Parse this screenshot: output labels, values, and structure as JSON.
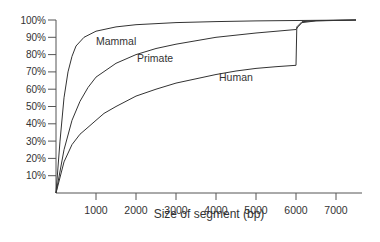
{
  "chart_data": {
    "type": "line",
    "title": "",
    "xlabel": "Size of segment (bp)",
    "ylabel": "",
    "xlim": [
      0,
      7650
    ],
    "ylim": [
      0,
      100
    ],
    "x_ticks": [
      1000,
      2000,
      3000,
      4000,
      5000,
      6000,
      7000
    ],
    "x_tick_labels": [
      "1000",
      "2000",
      "3000",
      "4000",
      "5000",
      "6000",
      "7000"
    ],
    "y_ticks": [
      10,
      20,
      30,
      40,
      50,
      60,
      70,
      80,
      90,
      100
    ],
    "y_tick_labels": [
      "10%",
      "20%",
      "30%",
      "40%",
      "50%",
      "60%",
      "70%",
      "80%",
      "90%",
      "100%"
    ],
    "grid": false,
    "legend": "inline labels",
    "series": [
      {
        "name": "Mammal",
        "label_pos": [
          1000,
          88
        ],
        "points": [
          [
            0,
            0
          ],
          [
            100,
            30
          ],
          [
            200,
            55
          ],
          [
            300,
            70
          ],
          [
            400,
            79
          ],
          [
            500,
            85
          ],
          [
            700,
            90
          ],
          [
            1000,
            93.5
          ],
          [
            1500,
            96
          ],
          [
            2000,
            97.3
          ],
          [
            3000,
            98.5
          ],
          [
            4000,
            99.1
          ],
          [
            5000,
            99.5
          ],
          [
            6000,
            99.7
          ],
          [
            7500,
            100
          ]
        ]
      },
      {
        "name": "Primate",
        "label_pos": [
          2000,
          78
        ],
        "points": [
          [
            0,
            0
          ],
          [
            200,
            25
          ],
          [
            400,
            42
          ],
          [
            600,
            53
          ],
          [
            800,
            61
          ],
          [
            1000,
            67
          ],
          [
            1500,
            75
          ],
          [
            2000,
            80
          ],
          [
            2500,
            83.5
          ],
          [
            3000,
            86
          ],
          [
            4000,
            90
          ],
          [
            5000,
            92.5
          ],
          [
            6000,
            94.5
          ],
          [
            6050,
            96
          ],
          [
            6150,
            98.5
          ],
          [
            6500,
            99.5
          ],
          [
            7500,
            100
          ]
        ]
      },
      {
        "name": "Human",
        "label_pos": [
          4000,
          65
        ],
        "points": [
          [
            0,
            0
          ],
          [
            200,
            18
          ],
          [
            400,
            28
          ],
          [
            600,
            34
          ],
          [
            800,
            38
          ],
          [
            1000,
            42
          ],
          [
            1200,
            46
          ],
          [
            1500,
            50
          ],
          [
            2000,
            56
          ],
          [
            2500,
            60
          ],
          [
            3000,
            63.5
          ],
          [
            3500,
            66
          ],
          [
            4000,
            68.5
          ],
          [
            4500,
            70.5
          ],
          [
            5000,
            72
          ],
          [
            5500,
            73
          ],
          [
            6000,
            73.8
          ],
          [
            6020,
            96
          ],
          [
            6150,
            99
          ],
          [
            6500,
            99.6
          ],
          [
            7500,
            100
          ]
        ]
      }
    ]
  }
}
